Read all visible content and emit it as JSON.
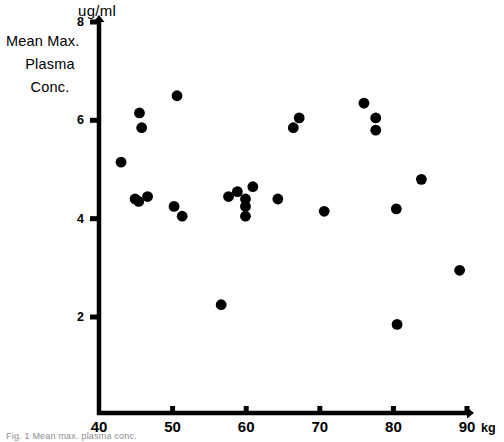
{
  "figure": {
    "y_unit_label": "ug/ml",
    "y_axis_title_line1": "Mean Max.",
    "y_axis_title_line2": "Plasma",
    "y_axis_title_line3": "Conc.",
    "x_unit_label": "kg",
    "caption": "Fig. 1 Mean max. plasma conc.",
    "ink_color": "#000000",
    "background_color": "#ffffff"
  },
  "chart_data": {
    "type": "scatter",
    "title": "",
    "xlabel": "kg",
    "ylabel": "Mean Max. Plasma Conc.",
    "y_unit": "ug/ml",
    "xlim": [
      40,
      90
    ],
    "ylim": [
      0,
      8
    ],
    "xticks": [
      40,
      50,
      60,
      70,
      80,
      90
    ],
    "xtick_labels": [
      "40",
      "50",
      "60",
      "70",
      "80",
      "90"
    ],
    "yticks": [
      2,
      4,
      6,
      8
    ],
    "ytick_labels": [
      "2",
      "4",
      "6",
      "8"
    ],
    "grid": false,
    "legend": null,
    "marker": "filled-circle",
    "marker_color": "#000000",
    "n_points": 27,
    "points": [
      {
        "x": 43.0,
        "y": 5.15
      },
      {
        "x": 45.5,
        "y": 6.15
      },
      {
        "x": 45.8,
        "y": 5.85
      },
      {
        "x": 50.6,
        "y": 6.5
      },
      {
        "x": 45.4,
        "y": 4.35
      },
      {
        "x": 46.6,
        "y": 4.45
      },
      {
        "x": 50.2,
        "y": 4.25
      },
      {
        "x": 51.3,
        "y": 4.05
      },
      {
        "x": 56.6,
        "y": 2.25
      },
      {
        "x": 57.6,
        "y": 4.45
      },
      {
        "x": 58.8,
        "y": 4.55
      },
      {
        "x": 59.9,
        "y": 4.4
      },
      {
        "x": 60.9,
        "y": 4.65
      },
      {
        "x": 59.9,
        "y": 4.25
      },
      {
        "x": 59.9,
        "y": 4.05
      },
      {
        "x": 64.3,
        "y": 4.4
      },
      {
        "x": 66.4,
        "y": 5.85
      },
      {
        "x": 67.2,
        "y": 6.05
      },
      {
        "x": 70.6,
        "y": 4.15
      },
      {
        "x": 76.0,
        "y": 6.35
      },
      {
        "x": 77.6,
        "y": 6.05
      },
      {
        "x": 77.6,
        "y": 5.8
      },
      {
        "x": 80.4,
        "y": 4.2
      },
      {
        "x": 83.8,
        "y": 4.8
      },
      {
        "x": 80.5,
        "y": 1.85
      },
      {
        "x": 89.0,
        "y": 2.95
      },
      {
        "x": 44.9,
        "y": 4.4
      }
    ]
  }
}
